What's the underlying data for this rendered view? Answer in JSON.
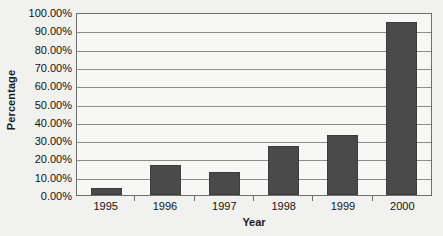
{
  "chart_data": {
    "type": "bar",
    "title": "",
    "xlabel": "Year",
    "ylabel": "Percentage",
    "categories": [
      "1995",
      "1996",
      "1997",
      "1998",
      "1999",
      "2000"
    ],
    "values": [
      4.0,
      16.5,
      12.5,
      27.0,
      33.0,
      94.5
    ],
    "value_labels": [
      "4.00%",
      "16.50%",
      "12.50%",
      "27.00%",
      "33.00%",
      "94.50%"
    ],
    "ylim": [
      0,
      100
    ],
    "ytick_labels": [
      "0.00%",
      "10.00%",
      "20.00%",
      "30.00%",
      "40.00%",
      "50.00%",
      "60.00%",
      "70.00%",
      "80.00%",
      "90.00%",
      "100.00%"
    ],
    "ytick_values": [
      0,
      10,
      20,
      30,
      40,
      50,
      60,
      70,
      80,
      90,
      100
    ],
    "grid": true,
    "grid_axis": "y",
    "legend": false,
    "legend_position": "none",
    "series": [
      {
        "name": "Percentage",
        "values": [
          4.0,
          16.5,
          12.5,
          27.0,
          33.0,
          94.5
        ]
      }
    ],
    "colors": {
      "bar": "#4a4a4a",
      "bar_border": "#3d3d3d",
      "plot_background": "#f7f7f5",
      "page_background": "#f1f1ef",
      "gridline": "#8d8d8d",
      "axis_line": "#6d6d6d",
      "text": "#111111"
    }
  }
}
